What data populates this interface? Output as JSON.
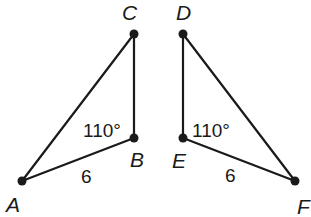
{
  "diagram": {
    "type": "geometry-triangles",
    "colors": {
      "stroke": "#1a1a1a",
      "background": "#ffffff"
    },
    "triangles": [
      {
        "name": "ABC",
        "vertices": {
          "A": {
            "label": "A",
            "x": 22,
            "y": 181
          },
          "B": {
            "label": "B",
            "x": 134,
            "y": 138
          },
          "C": {
            "label": "C",
            "x": 134,
            "y": 34
          }
        },
        "angle_label": "110°",
        "side_label": "6"
      },
      {
        "name": "DEF",
        "vertices": {
          "D": {
            "label": "D",
            "x": 183,
            "y": 34
          },
          "E": {
            "label": "E",
            "x": 183,
            "y": 138
          },
          "F": {
            "label": "F",
            "x": 295,
            "y": 181
          }
        },
        "angle_label": "110°",
        "side_label": "6"
      }
    ]
  }
}
